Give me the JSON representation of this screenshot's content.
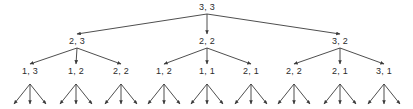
{
  "diagram": {
    "type": "tree",
    "title": "",
    "background_color": "#ffffff",
    "line_color": "#3a3a3a",
    "text_color": "#2b2b2b",
    "width": 413,
    "height": 109,
    "levels": 4,
    "branching_factor": 3,
    "arrow_direction": "downward",
    "root": {
      "id": "root",
      "label": "3, 3",
      "x": 207,
      "y": 8
    },
    "level2": [
      {
        "id": "n2-0",
        "label": "2, 3",
        "x": 77,
        "y": 42
      },
      {
        "id": "n2-1",
        "label": "2, 2",
        "x": 207,
        "y": 42
      },
      {
        "id": "n2-2",
        "label": "3, 2",
        "x": 340,
        "y": 42
      }
    ],
    "level3": [
      {
        "id": "n3-0",
        "label": "1, 3",
        "x": 30,
        "y": 72,
        "parent": "n2-0"
      },
      {
        "id": "n3-1",
        "label": "1, 2",
        "x": 76,
        "y": 72,
        "parent": "n2-0"
      },
      {
        "id": "n3-2",
        "label": "2, 2",
        "x": 121,
        "y": 72,
        "parent": "n2-0"
      },
      {
        "id": "n3-3",
        "label": "1, 2",
        "x": 164,
        "y": 72,
        "parent": "n2-1"
      },
      {
        "id": "n3-4",
        "label": "1, 1",
        "x": 207,
        "y": 72,
        "parent": "n2-1"
      },
      {
        "id": "n3-5",
        "label": "2, 1",
        "x": 251,
        "y": 72,
        "parent": "n2-1"
      },
      {
        "id": "n3-6",
        "label": "2, 2",
        "x": 294,
        "y": 72,
        "parent": "n2-2"
      },
      {
        "id": "n3-7",
        "label": "2, 1",
        "x": 340,
        "y": 72,
        "parent": "n2-2"
      },
      {
        "id": "n3-8",
        "label": "3, 1",
        "x": 384,
        "y": 72,
        "parent": "n2-2"
      }
    ],
    "leaf_clusters": [
      {
        "id": "leaf-0",
        "x": 30,
        "parent": "n3-0"
      },
      {
        "id": "leaf-1",
        "x": 76,
        "parent": "n3-1"
      },
      {
        "id": "leaf-2",
        "x": 121,
        "parent": "n3-2"
      },
      {
        "id": "leaf-3",
        "x": 164,
        "parent": "n3-3"
      },
      {
        "id": "leaf-4",
        "x": 207,
        "parent": "n3-4"
      },
      {
        "id": "leaf-5",
        "x": 251,
        "parent": "n3-5"
      },
      {
        "id": "leaf-6",
        "x": 294,
        "parent": "n3-6"
      },
      {
        "id": "leaf-7",
        "x": 340,
        "parent": "n3-7"
      },
      {
        "id": "leaf-8",
        "x": 384,
        "parent": "n3-8"
      }
    ],
    "leaf_geometry": {
      "top_y": 84,
      "bottom_y": 104,
      "spread": 16
    }
  }
}
